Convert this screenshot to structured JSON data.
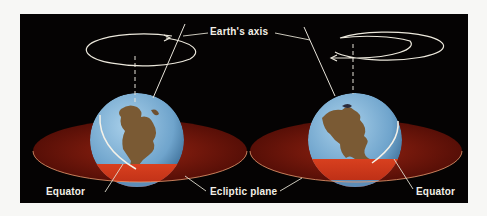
{
  "diagram": {
    "labels": {
      "axis": "Earth's axis",
      "equator_left": "Equator",
      "ecliptic": "Ecliptic plane",
      "equator_right": "Equator"
    },
    "colors": {
      "background": "#050303",
      "page": "#f7f7f5",
      "ocean": "#7fb3d8",
      "land": "#7a5a34",
      "ecliptic_disc": "#8a1a0c",
      "ecliptic_band": "#c8321a",
      "line": "#ece8dc"
    },
    "globes": [
      {
        "id": "left",
        "rotation": "counterclockwise-as-drawn",
        "arrow_direction": "right"
      },
      {
        "id": "right",
        "rotation": "clockwise-as-drawn",
        "arrow_direction": "left"
      }
    ]
  }
}
